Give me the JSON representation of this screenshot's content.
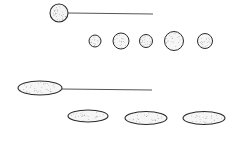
{
  "figure": {
    "colors": {
      "ink": "#2a2a2a",
      "background": "#ffffff"
    },
    "cocci": {
      "flagellated": {
        "cx": 59,
        "cy": 13,
        "r": 9,
        "flagellum": [
          68,
          13,
          153,
          14
        ]
      },
      "row": [
        {
          "cx": 95,
          "cy": 41,
          "r": 6
        },
        {
          "cx": 121,
          "cy": 41,
          "r": 8
        },
        {
          "cx": 146,
          "cy": 41,
          "r": 6.5
        },
        {
          "cx": 174,
          "cy": 41,
          "r": 9.5
        },
        {
          "cx": 205,
          "cy": 41,
          "r": 7.5
        }
      ]
    },
    "bacilli": {
      "flagellated": {
        "cx": 40,
        "cy": 88,
        "rx": 22,
        "ry": 7,
        "flagellum": [
          62,
          89,
          152,
          90
        ]
      },
      "row": [
        {
          "cx": 88,
          "cy": 116,
          "rx": 20,
          "ry": 6
        },
        {
          "cx": 146,
          "cy": 118,
          "rx": 21,
          "ry": 6.5
        },
        {
          "cx": 204,
          "cy": 118,
          "rx": 21,
          "ry": 6.5
        }
      ]
    }
  }
}
